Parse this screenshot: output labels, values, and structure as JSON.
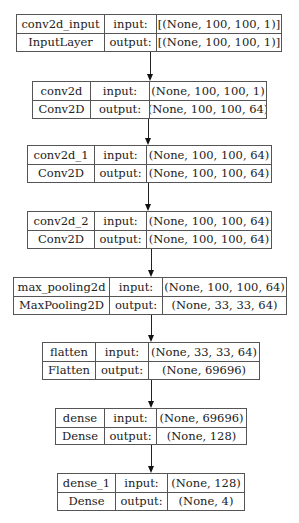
{
  "diagram": {
    "type": "keras-model-plot",
    "nodes": [
      {
        "name": "conv2d_input",
        "class": "InputLayer",
        "input_label": "input:",
        "output_label": "output:",
        "input_shape": "[(None, 100, 100, 1)]",
        "output_shape": "[(None, 100, 100, 1)]",
        "box": {
          "x": 16,
          "y": 14,
          "w": 266,
          "h": 38,
          "c1": 87,
          "c2": 52
        }
      },
      {
        "name": "conv2d",
        "class": "Conv2D",
        "input_label": "input:",
        "output_label": "output:",
        "input_shape": "(None, 100, 100, 1)",
        "output_shape": "(None, 100, 100, 64)",
        "box": {
          "x": 32,
          "y": 81,
          "w": 235,
          "h": 38,
          "c1": 57,
          "c2": 59
        }
      },
      {
        "name": "conv2d_1",
        "class": "Conv2D",
        "input_label": "input:",
        "output_label": "output:",
        "input_shape": "(None, 100, 100, 64)",
        "output_shape": "(None, 100, 100, 64)",
        "box": {
          "x": 27,
          "y": 145,
          "w": 245,
          "h": 38,
          "c1": 66,
          "c2": 52
        }
      },
      {
        "name": "conv2d_2",
        "class": "Conv2D",
        "input_label": "input:",
        "output_label": "output:",
        "input_shape": "(None, 100, 100, 64)",
        "output_shape": "(None, 100, 100, 64)",
        "box": {
          "x": 27,
          "y": 211,
          "w": 245,
          "h": 38,
          "c1": 66,
          "c2": 52
        }
      },
      {
        "name": "max_pooling2d",
        "class": "MaxPooling2D",
        "input_label": "input:",
        "output_label": "output:",
        "input_shape": "(None, 100, 100, 64)",
        "output_shape": "(None, 33, 33, 64)",
        "box": {
          "x": 13,
          "y": 277,
          "w": 274,
          "h": 38,
          "c1": 95,
          "c2": 53
        }
      },
      {
        "name": "flatten",
        "class": "Flatten",
        "input_label": "input:",
        "output_label": "output:",
        "input_shape": "(None, 33, 33, 64)",
        "output_shape": "(None, 69696)",
        "box": {
          "x": 42,
          "y": 342,
          "w": 218,
          "h": 38,
          "c1": 52,
          "c2": 53
        }
      },
      {
        "name": "dense",
        "class": "Dense",
        "input_label": "input:",
        "output_label": "output:",
        "input_shape": "(None, 69696)",
        "output_shape": "(None, 128)",
        "box": {
          "x": 55,
          "y": 408,
          "w": 192,
          "h": 37,
          "c1": 48,
          "c2": 52
        }
      },
      {
        "name": "dense_1",
        "class": "Dense",
        "input_label": "input:",
        "output_label": "output:",
        "input_shape": "(None, 128)",
        "output_shape": "(None, 4)",
        "box": {
          "x": 57,
          "y": 473,
          "w": 188,
          "h": 38,
          "c1": 57,
          "c2": 52
        }
      }
    ],
    "edges": [
      {
        "from": "conv2d_input",
        "to": "conv2d",
        "x": 150,
        "y1": 52,
        "y2": 81
      },
      {
        "from": "conv2d",
        "to": "conv2d_1",
        "x": 148,
        "y1": 119,
        "y2": 145
      },
      {
        "from": "conv2d_1",
        "to": "conv2d_2",
        "x": 148,
        "y1": 183,
        "y2": 211
      },
      {
        "from": "conv2d_2",
        "to": "max_pooling2d",
        "x": 151,
        "y1": 249,
        "y2": 277
      },
      {
        "from": "max_pooling2d",
        "to": "flatten",
        "x": 151,
        "y1": 315,
        "y2": 342
      },
      {
        "from": "flatten",
        "to": "dense",
        "x": 151,
        "y1": 380,
        "y2": 408
      },
      {
        "from": "dense",
        "to": "dense_1",
        "x": 151,
        "y1": 445,
        "y2": 473
      }
    ]
  }
}
